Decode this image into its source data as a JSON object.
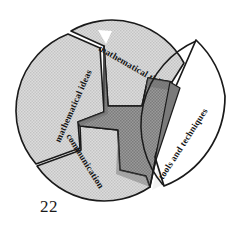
{
  "figure": {
    "name": "pinwheel-diagram",
    "type": "pinwheel",
    "page_number": "22",
    "outline_color": "#1a1a1a",
    "blade_fill": "#d2d2d2",
    "hub_fill": "#8f8f8f",
    "exploded_fill": "#ffffff",
    "background": "#ffffff",
    "blades": [
      {
        "id": "mathematical-thinking",
        "label": "mathematical thinking",
        "position": "top",
        "fill": "#d2d2d2",
        "exploded": false
      },
      {
        "id": "tools-and-techniques",
        "label": "tools and techniques",
        "position": "right",
        "fill": "#ffffff",
        "exploded": true
      },
      {
        "id": "communication",
        "label": "communication",
        "position": "bottom",
        "fill": "#d2d2d2",
        "exploded": false
      },
      {
        "id": "mathematical-ideas",
        "label": "mathematical ideas",
        "position": "left",
        "fill": "#d2d2d2",
        "exploded": false
      }
    ]
  }
}
